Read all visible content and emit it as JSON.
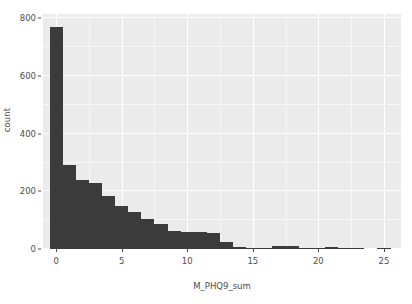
{
  "chart_data": {
    "type": "bar",
    "title": "",
    "subtitle": "",
    "xlabel": "M_PHQ9_sum",
    "ylabel": "count",
    "xlim": [
      -1.0,
      26.3
    ],
    "ylim": [
      0,
      815
    ],
    "grid": true,
    "legend": "none",
    "bar_color": "#3b3b3b",
    "panel_color": "#ebebeb",
    "gridline_color": "#ffffff",
    "bin_width": 1,
    "x_ticks": [
      {
        "value": 0,
        "label": "0"
      },
      {
        "value": 5,
        "label": "5"
      },
      {
        "value": 10,
        "label": "10"
      },
      {
        "value": 15,
        "label": "15"
      },
      {
        "value": 20,
        "label": "20"
      },
      {
        "value": 25,
        "label": "25"
      }
    ],
    "x_minor_ticks": [
      2.5,
      7.5,
      12.5,
      17.5,
      22.5
    ],
    "y_ticks": [
      {
        "value": 0,
        "label": "0"
      },
      {
        "value": 200,
        "label": "200"
      },
      {
        "value": 400,
        "label": "400"
      },
      {
        "value": 600,
        "label": "600"
      },
      {
        "value": 800,
        "label": "800"
      }
    ],
    "y_minor_ticks": [
      100,
      300,
      500,
      700
    ],
    "categories": [
      0,
      1,
      2,
      3,
      4,
      5,
      6,
      7,
      8,
      9,
      10,
      11,
      12,
      13,
      14,
      15,
      16,
      17,
      18,
      19,
      20,
      21,
      22,
      23,
      24,
      25
    ],
    "values": [
      770,
      292,
      238,
      230,
      185,
      150,
      128,
      103,
      86,
      62,
      58,
      58,
      56,
      24,
      6,
      5,
      4,
      12,
      12,
      5,
      2,
      7,
      3,
      1,
      0,
      1
    ],
    "series": [
      {
        "name": "count",
        "values": [
          770,
          292,
          238,
          230,
          185,
          150,
          128,
          103,
          86,
          62,
          58,
          58,
          56,
          24,
          6,
          5,
          4,
          12,
          12,
          5,
          2,
          7,
          3,
          1,
          0,
          1
        ]
      }
    ],
    "annotations": []
  }
}
